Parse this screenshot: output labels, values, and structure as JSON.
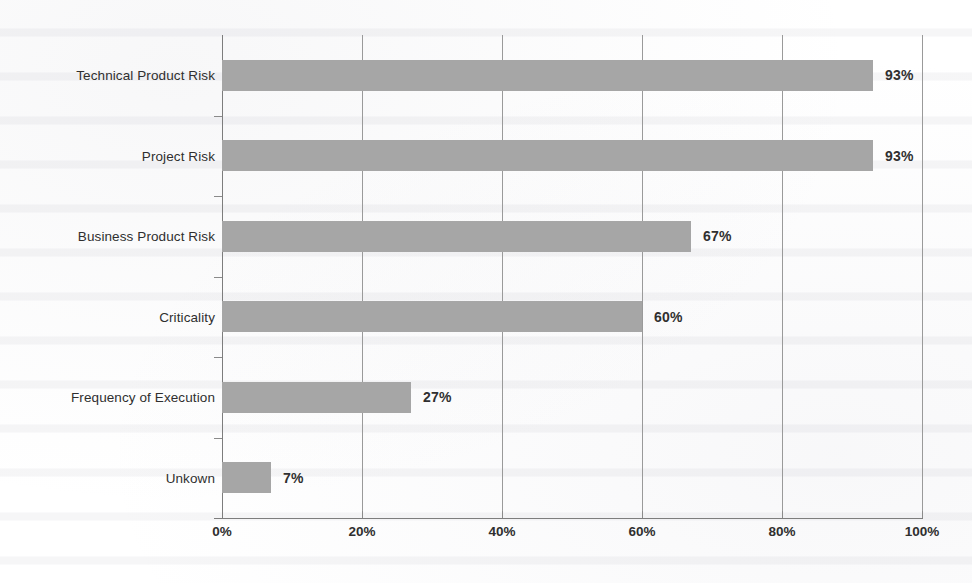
{
  "chart_data": {
    "type": "bar",
    "orientation": "horizontal",
    "title": "",
    "subtitle": "",
    "xlabel": "",
    "ylabel": "",
    "categories": [
      "Technical Product Risk",
      "Project Risk",
      "Business Product Risk",
      "Criticality",
      "Frequency of Execution",
      "Unkown"
    ],
    "values": [
      93,
      93,
      67,
      60,
      27,
      7
    ],
    "value_labels": [
      "93%",
      "93%",
      "67%",
      "60%",
      "27%",
      "7%"
    ],
    "unit": "%",
    "xlim": [
      0,
      100
    ],
    "xticks": [
      0,
      20,
      40,
      60,
      80,
      100
    ],
    "xtick_labels": [
      "0%",
      "20%",
      "40%",
      "60%",
      "80%",
      "100%"
    ],
    "grid": "vertical",
    "legend": "none",
    "bar_color": "#a6a6a6",
    "axis_color": "#7d7d7d",
    "gridline_color": "#9a9a9a",
    "text_color": "#2f2f2f",
    "background_color": "#ffffff"
  }
}
